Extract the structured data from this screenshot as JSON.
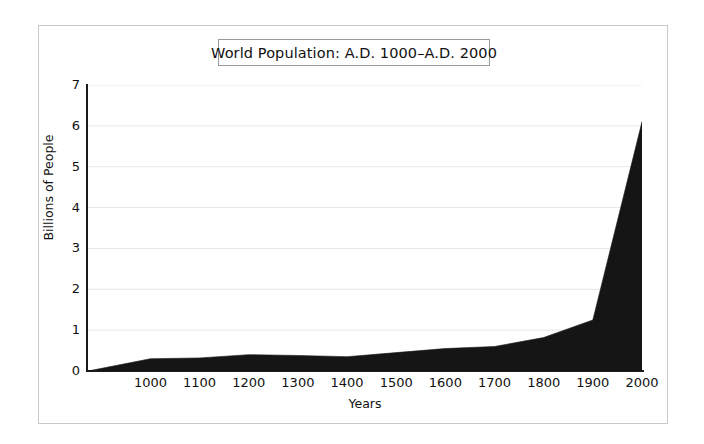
{
  "figure": {
    "title": "World Population:  A.D. 1000–A.D. 2000",
    "frame_border_color": "#c9c9c9",
    "title_border_color": "#9a9a9a",
    "background_color": "#ffffff"
  },
  "chart_data": {
    "type": "area",
    "title": "World Population:  A.D. 1000–A.D. 2000",
    "xlabel": "Years",
    "ylabel": "Billions of People",
    "xlim": [
      873,
      2000
    ],
    "ylim": [
      0,
      7
    ],
    "grid": "horizontal",
    "legend": "none",
    "series_color": "#151515",
    "axis_color": "#1a1a1a",
    "gridline_color": "#e8e8e8",
    "x_ticks": [
      1000,
      1100,
      1200,
      1300,
      1400,
      1500,
      1600,
      1700,
      1800,
      1900,
      2000
    ],
    "x_tick_labels": [
      "1000",
      "1100",
      "1200",
      "1300",
      "1400",
      "1500",
      "1600",
      "1700",
      "1800",
      "1900",
      "2000"
    ],
    "y_ticks": [
      0,
      1,
      2,
      3,
      4,
      5,
      6,
      7
    ],
    "y_tick_labels": [
      "0",
      "1",
      "2",
      "3",
      "4",
      "5",
      "6",
      "7"
    ],
    "x": [
      873,
      1000,
      1100,
      1200,
      1300,
      1400,
      1500,
      1600,
      1700,
      1800,
      1900,
      2000
    ],
    "values": [
      0.0,
      0.3,
      0.32,
      0.4,
      0.38,
      0.35,
      0.45,
      0.55,
      0.6,
      0.82,
      1.25,
      6.1
    ],
    "series": [
      {
        "name": "World Population",
        "values": [
          0.0,
          0.3,
          0.32,
          0.4,
          0.38,
          0.35,
          0.45,
          0.55,
          0.6,
          0.82,
          1.25,
          6.1
        ]
      }
    ]
  }
}
